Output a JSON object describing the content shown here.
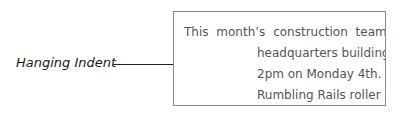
{
  "annotation": {
    "label": "Hanging Indent"
  },
  "document": {
    "lines": [
      "This month’s construction team",
      "headquarters building",
      "2pm on Monday 4th. A",
      "Rumbling Rails roller co"
    ]
  },
  "colors": {
    "text": "#555555",
    "border": "#8a8a8a",
    "leader": "#222222"
  }
}
